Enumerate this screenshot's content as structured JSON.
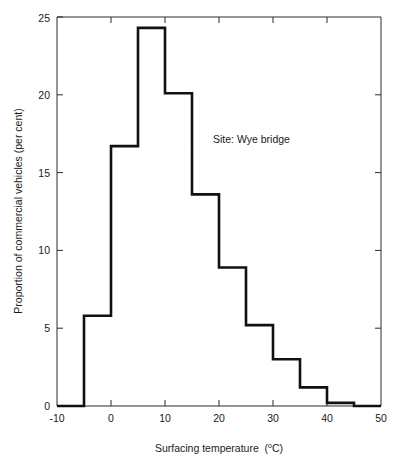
{
  "figure": {
    "top_edge_artifact": "­ ­ ­ ­ ­ ­",
    "background_color": "#ffffff",
    "line_color": "#111111",
    "axis_color": "#2b2b2b"
  },
  "annotation": {
    "site_label": "Site: Wye bridge"
  },
  "axis_titles": {
    "x_main": "Surfacing temperature",
    "x_unit_sup": "o",
    "x_unit_rest": "C",
    "x_unit_open": "(",
    "x_unit_close": ")",
    "y": "Proportion of commercial vehicles (per cent)"
  },
  "ticks": {
    "x": [
      "-10",
      "0",
      "10",
      "20",
      "30",
      "40",
      "50"
    ],
    "y": [
      "0",
      "5",
      "10",
      "15",
      "20",
      "25"
    ]
  },
  "chart_data": {
    "type": "bar",
    "title": "",
    "subtitle": "",
    "annotations": [
      "Site: Wye bridge"
    ],
    "xlabel": "Surfacing temperature (°C)",
    "ylabel": "Proportion of commercial vehicles (per cent)",
    "xlim": [
      -10,
      50
    ],
    "ylim": [
      0,
      25
    ],
    "xticks": [
      -10,
      0,
      10,
      20,
      30,
      40,
      50
    ],
    "yticks": [
      0,
      5,
      10,
      15,
      20,
      25
    ],
    "grid": false,
    "legend": "none",
    "style": "histogram-outline",
    "bin_width": 5,
    "bin_edges": [
      -10,
      -5,
      0,
      5,
      10,
      15,
      20,
      25,
      30,
      35,
      40,
      45,
      50
    ],
    "categories": [
      "-10 to -5",
      "-5 to 0",
      "0 to 5",
      "5 to 10",
      "10 to 15",
      "15 to 20",
      "20 to 25",
      "25 to 30",
      "30 to 35",
      "35 to 40",
      "40 to 45",
      "45 to 50"
    ],
    "values": [
      0,
      5.8,
      16.7,
      24.3,
      20.1,
      13.6,
      8.9,
      5.2,
      3.0,
      1.2,
      0.2,
      0
    ]
  }
}
